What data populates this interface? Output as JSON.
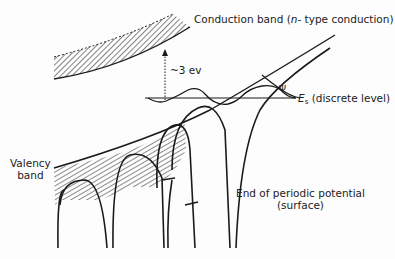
{
  "labels": {
    "conduction_band_prefix": "Conduction band (",
    "conduction_band_n": "n",
    "conduction_band_suffix": "- type conduction)",
    "energy_gap": "~3 ev",
    "psi": "Ψ",
    "es_symbol": "E",
    "es_subscript": "s",
    "es_text": " (discrete level)",
    "valency_line1": "Valency",
    "valency_line2": "band",
    "surface_line1": "End of periodic potential",
    "surface_line2": "(surface)"
  },
  "colors": {
    "ink": "#1a1a1a",
    "background": "#fdfdfd"
  }
}
